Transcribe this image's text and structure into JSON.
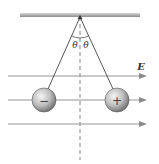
{
  "diagram": {
    "field_label": "E",
    "angle_label_left": "θ",
    "angle_label_right": "θ",
    "left_ball": {
      "charge_sign": "−"
    },
    "right_ball": {
      "charge_sign": "+"
    },
    "field_lines_count": 3,
    "colors": {
      "ceiling": "#999999",
      "string": "#444444",
      "field_line": "#8a8a8a",
      "ball_light": "#f2f2f2",
      "ball_dark": "#6e6e6e"
    }
  }
}
